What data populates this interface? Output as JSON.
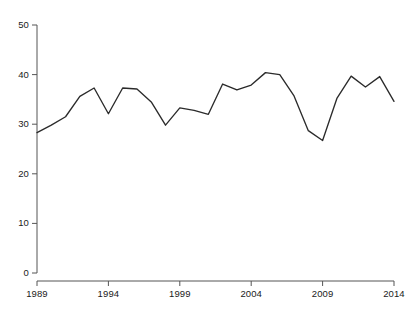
{
  "chart_data": {
    "type": "line",
    "title": "",
    "subtitle": "",
    "xlabel": "",
    "ylabel": "",
    "grid": false,
    "legend": false,
    "legend_position": "none",
    "line_color": "#2b2b2b",
    "background_color": "#ffffff",
    "axis_color": "#555555",
    "xlim": [
      1989,
      2014
    ],
    "ylim": [
      0,
      50
    ],
    "x_ticks": [
      1989,
      1994,
      1999,
      2004,
      2009,
      2014
    ],
    "x_tick_labels": [
      "1989",
      "1994",
      "1999",
      "2004",
      "2009",
      "2014"
    ],
    "y_ticks": [
      0,
      10,
      20,
      30,
      40,
      50
    ],
    "y_tick_labels": [
      "0",
      "10",
      "20",
      "30",
      "40",
      "50"
    ],
    "x": [
      1989,
      1990,
      1991,
      1992,
      1993,
      1994,
      1995,
      1996,
      1997,
      1998,
      1999,
      2000,
      2001,
      2002,
      2003,
      2004,
      2005,
      2006,
      2007,
      2008,
      2009,
      2010,
      2011,
      2012,
      2013,
      2014
    ],
    "values": [
      28.3,
      29.8,
      31.5,
      35.6,
      37.3,
      32.1,
      37.3,
      37.1,
      34.5,
      29.8,
      33.3,
      32.8,
      32.0,
      38.1,
      36.9,
      37.9,
      40.4,
      40.0,
      35.7,
      28.7,
      26.7,
      35.2,
      39.7,
      37.5,
      39.6,
      34.6
    ],
    "series": [
      {
        "name": "series-1",
        "values": [
          28.3,
          29.8,
          31.5,
          35.6,
          37.3,
          32.1,
          37.3,
          37.1,
          34.5,
          29.8,
          33.3,
          32.8,
          32.0,
          38.1,
          36.9,
          37.9,
          40.4,
          40.0,
          35.7,
          28.7,
          26.7,
          35.2,
          39.7,
          37.5,
          39.6,
          34.6
        ]
      }
    ]
  }
}
